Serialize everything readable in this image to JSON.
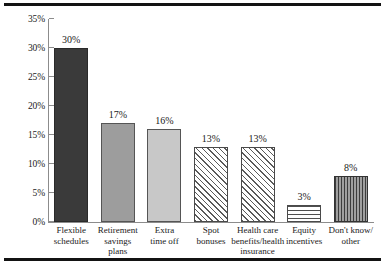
{
  "chart_data": {
    "type": "bar",
    "title": "",
    "subtitle": "",
    "xlabel": "",
    "ylabel": "",
    "ylim": [
      0,
      35
    ],
    "grid": false,
    "legend": "none",
    "y_ticks": [
      "0%",
      "5%",
      "10%",
      "15%",
      "20%",
      "25%",
      "30%",
      "35%"
    ],
    "y_tick_values": [
      0,
      5,
      10,
      15,
      20,
      25,
      30,
      35
    ],
    "categories": [
      "Flexible schedules",
      "Retirement savings plans",
      "Extra time off",
      "Spot bonuses",
      "Health care benefits/health insurance",
      "Equity incentives",
      "Don't know/ other"
    ],
    "values": [
      30,
      17,
      16,
      13,
      13,
      3,
      8
    ],
    "data_labels": [
      "30%",
      "17%",
      "16%",
      "13%",
      "13%",
      "3%",
      "8%"
    ],
    "bars": [
      {
        "category_lines": [
          "Flexible",
          "schedules"
        ],
        "value": 30,
        "label": "30%",
        "fill": "solid-dark",
        "color": "#3a3a3a"
      },
      {
        "category_lines": [
          "Retirement",
          "savings",
          "plans"
        ],
        "value": 17,
        "label": "17%",
        "fill": "solid-mid",
        "color": "#9d9d9d"
      },
      {
        "category_lines": [
          "Extra",
          "time off"
        ],
        "value": 16,
        "label": "16%",
        "fill": "solid-light",
        "color": "#c8c8c8"
      },
      {
        "category_lines": [
          "Spot",
          "bonuses"
        ],
        "value": 13,
        "label": "13%",
        "fill": "diagonal-hatch",
        "color": "#5a5a5a"
      },
      {
        "category_lines": [
          "Health care",
          "benefits/health",
          "insurance"
        ],
        "value": 13,
        "label": "13%",
        "fill": "diagonal-hatch",
        "color": "#5a5a5a"
      },
      {
        "category_lines": [
          "Equity",
          "incentives"
        ],
        "value": 3,
        "label": "3%",
        "fill": "horizontal-lines",
        "color": "#4f4f4f"
      },
      {
        "category_lines": [
          "Don't know/",
          "other"
        ],
        "value": 8,
        "label": "8%",
        "fill": "vertical-lines",
        "color": "#6e6e6e"
      }
    ]
  },
  "colors": {
    "rule": "#131313",
    "axis": "#8c8c8c",
    "text": "#1a1a1a",
    "background": "#ffffff"
  }
}
